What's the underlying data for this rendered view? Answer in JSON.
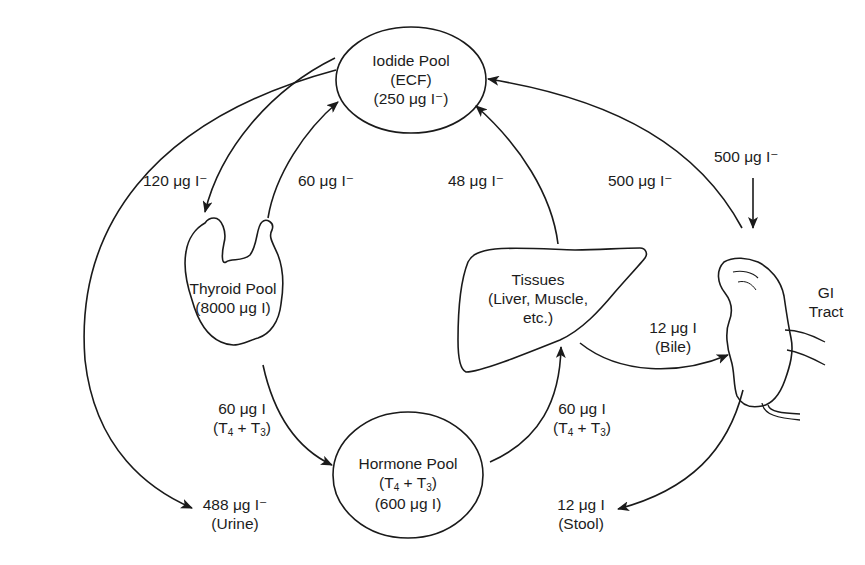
{
  "diagram": {
    "nodes": {
      "iodide_pool": {
        "line1": "Iodide Pool",
        "line2": "(ECF)",
        "line3": "(250 μg I⁻)"
      },
      "thyroid_pool": {
        "line1": "Thyroid Pool",
        "line2": "(8000 μg I)"
      },
      "hormone_pool": {
        "line1": "Hormone Pool",
        "line2_a": "(T",
        "line2_s1": "4",
        "line2_b": " + T",
        "line2_s2": "3",
        "line2_c": ")",
        "line3": "(600 μg I)"
      },
      "tissues": {
        "line1": "Tissues",
        "line2": "(Liver, Muscle,",
        "line3": "etc.)"
      },
      "gi_tract": {
        "line1": "GI",
        "line2": "Tract"
      }
    },
    "flows": {
      "iodide_to_thyroid": {
        "value": "120 μg I⁻"
      },
      "thyroid_to_iodide": {
        "value": "60 μg I⁻"
      },
      "tissues_to_iodide": {
        "value": "48 μg I⁻"
      },
      "gi_to_iodide": {
        "value": "500 μg I⁻"
      },
      "intake_to_gi": {
        "value": "500 μg I⁻"
      },
      "thyroid_to_hormone": {
        "value": "60 μg I",
        "note_a": "(T",
        "note_s1": "4",
        "note_b": " + T",
        "note_s2": "3",
        "note_c": ")"
      },
      "hormone_to_tissues": {
        "value": "60 μg I",
        "note_a": "(T",
        "note_s1": "4",
        "note_b": " + T",
        "note_s2": "3",
        "note_c": ")"
      },
      "tissues_to_gi": {
        "value": "12 μg I",
        "note": "(Bile)"
      },
      "iodide_to_urine": {
        "value": "488 μg I⁻",
        "note": "(Urine)"
      },
      "gi_to_stool": {
        "value": "12 μg I",
        "note": "(Stool)"
      }
    },
    "colors": {
      "ink": "#1a1a1a",
      "background": "#ffffff"
    }
  }
}
